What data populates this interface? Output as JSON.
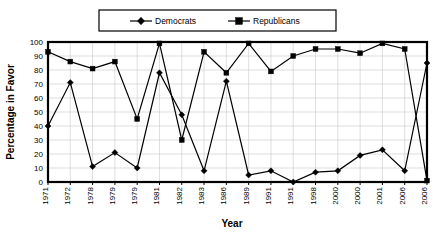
{
  "chart_data": {
    "type": "line",
    "title": "",
    "xlabel": "Year",
    "ylabel": "Percentage in Favor",
    "ylim": [
      0,
      100
    ],
    "ytick_step": 10,
    "yticks": [
      0,
      10,
      20,
      30,
      40,
      50,
      60,
      70,
      80,
      90,
      100
    ],
    "grid": true,
    "legend_position": "top-center",
    "categories": [
      "1971",
      "1972",
      "1978",
      "1979",
      "1979",
      "1981",
      "1982",
      "1983",
      "1986",
      "1989",
      "1991",
      "1991",
      "1998",
      "2000",
      "2000",
      "2001",
      "2006",
      "2006"
    ],
    "series": [
      {
        "name": "Democrats",
        "marker": "diamond",
        "color": "#000000",
        "values": [
          40,
          71,
          11,
          21,
          10,
          78,
          48,
          8,
          72,
          5,
          8,
          0,
          7,
          8,
          19,
          23,
          8,
          85
        ]
      },
      {
        "name": "Republicans",
        "marker": "square",
        "color": "#000000",
        "values": [
          93,
          86,
          81,
          86,
          45,
          99,
          30,
          93,
          78,
          99,
          79,
          90,
          95,
          95,
          92,
          99,
          95,
          1
        ]
      }
    ]
  },
  "legend": {
    "entries": [
      {
        "label": "Democrats"
      },
      {
        "label": "Republicans"
      }
    ]
  },
  "axes": {
    "y_title": "Percentage in Favor",
    "x_title": "Year"
  }
}
